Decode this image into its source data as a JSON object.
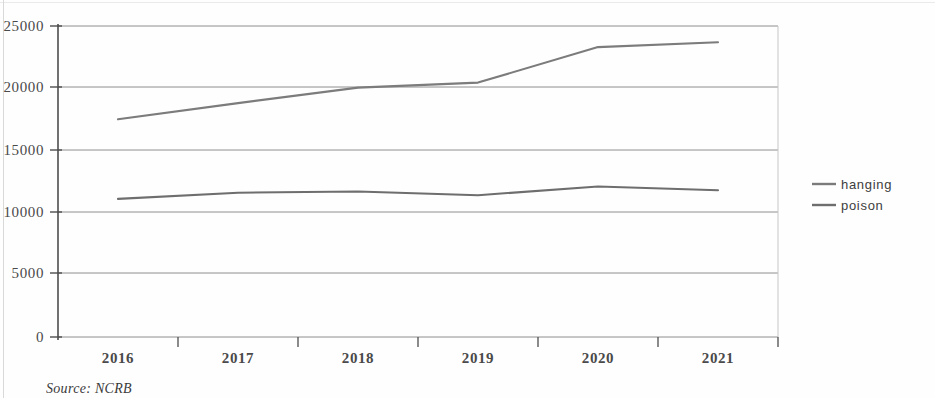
{
  "figure": {
    "source_caption": "Source: NCRB"
  },
  "legend": {
    "position": "right",
    "entries": [
      {
        "label": "hanging",
        "color": "#7b7b7b"
      },
      {
        "label": "poison",
        "color": "#6e6e6e"
      }
    ]
  },
  "axes": {
    "y_ticks": [
      "0",
      "5000",
      "10000",
      "15000",
      "20000",
      "25000"
    ],
    "x_ticks": [
      "2016",
      "2017",
      "2018",
      "2019",
      "2020",
      "2021"
    ]
  },
  "chart_data": {
    "type": "line",
    "title": "",
    "subtitle": "",
    "xlabel": "",
    "ylabel": "",
    "categories": [
      "2016",
      "2017",
      "2018",
      "2019",
      "2020",
      "2021"
    ],
    "series": [
      {
        "name": "hanging",
        "color": "#7b7b7b",
        "values": [
          17500,
          18800,
          20050,
          20450,
          23300,
          23700
        ]
      },
      {
        "name": "poison",
        "color": "#6e6e6e",
        "values": [
          11100,
          11600,
          11700,
          11400,
          12100,
          11800
        ]
      }
    ],
    "ylim": [
      0,
      25000
    ],
    "ytick_interval": 5000,
    "grid": "horizontal",
    "legend_position": "right",
    "annotations": [
      "Source: NCRB"
    ]
  }
}
